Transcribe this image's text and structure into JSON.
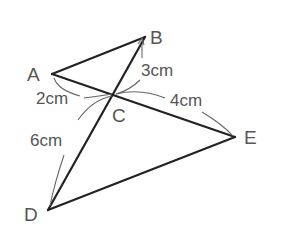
{
  "diagram": {
    "type": "geometry",
    "points": {
      "A": {
        "label": "A",
        "x": 52,
        "y": 74
      },
      "B": {
        "label": "B",
        "x": 145,
        "y": 37
      },
      "C": {
        "label": "C",
        "x": 114,
        "y": 94
      },
      "D": {
        "label": "D",
        "x": 48,
        "y": 210
      },
      "E": {
        "label": "E",
        "x": 235,
        "y": 137
      }
    },
    "segments": [
      "AB",
      "AE",
      "BD",
      "DE"
    ],
    "measurements": {
      "AC": "2cm",
      "BC": "3cm",
      "CE": "4cm",
      "CD": "6cm"
    },
    "colors": {
      "line": "#222222",
      "label": "#555555",
      "arc": "#666666"
    }
  }
}
